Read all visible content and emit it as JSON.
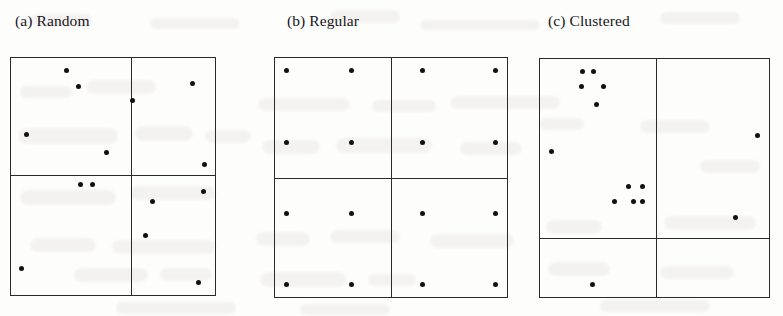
{
  "figure": {
    "caption_style": "panel-lettered",
    "background_color": "#fdfdfc",
    "ink_color": "#111113",
    "line_color": "#2a2a2c"
  },
  "panels": [
    {
      "id": "panel-a",
      "title": "(a) Random",
      "title_x": 15,
      "title_y": 12,
      "box": {
        "x": 10,
        "y": 57,
        "w": 206,
        "h": 239
      },
      "divider_x": 131,
      "divider_y": 175,
      "quadrant_counts": {
        "top_left": 4,
        "top_right": 4,
        "bottom_left": 3,
        "bottom_right": 3
      }
    },
    {
      "id": "panel-b",
      "title": "(b) Regular",
      "title_x": 287,
      "title_y": 12,
      "box": {
        "x": 274,
        "y": 57,
        "w": 234,
        "h": 241
      },
      "divider_x": 391,
      "divider_y": 178,
      "quadrant_counts": {
        "top_left": 4,
        "top_right": 4,
        "bottom_left": 4,
        "bottom_right": 4
      }
    },
    {
      "id": "panel-c",
      "title": "(c) Clustered",
      "title_x": 548,
      "title_y": 12,
      "box": {
        "x": 539,
        "y": 58,
        "w": 231,
        "h": 240
      },
      "divider_x": 656,
      "divider_y": 238,
      "quadrant_counts": {
        "top_left": 6,
        "top_right": 1,
        "bottom_left": 6,
        "bottom_right": 1
      }
    }
  ],
  "chart_data": {
    "type": "scatter",
    "xlabel": "",
    "ylabel": "",
    "grid": false,
    "legend": null,
    "axis_ticks": false,
    "note": "Three 2x2 quadrat-partitioned unit squares illustrating random, regular and clustered spatial point patterns. Coordinates are given in screenshot pixel space.",
    "series": [
      {
        "name": "(a) Random",
        "panel": "panel-a",
        "marker": "filled-circle",
        "marker_size_px": 5,
        "color": "#111113",
        "n_points": 14,
        "points": [
          [
            85,
            75
          ],
          [
            96,
            92
          ],
          [
            147,
            106
          ],
          [
            203,
            89
          ],
          [
            48,
            141
          ],
          [
            213,
            199
          ],
          [
            122,
            159
          ],
          [
            214,
            172
          ],
          [
            98,
            192
          ],
          [
            109,
            192
          ],
          [
            165,
            210
          ],
          [
            159,
            244
          ],
          [
            43,
            278
          ],
          [
            208,
            293
          ]
        ]
      },
      {
        "name": "(b) Regular",
        "panel": "panel-b",
        "marker": "filled-circle",
        "marker_size_px": 5,
        "color": "#111113",
        "n_points": 16,
        "points": [
          [
            310,
            129
          ],
          [
            368,
            129
          ],
          [
            431,
            129
          ],
          [
            496,
            129
          ],
          [
            310,
            198
          ],
          [
            368,
            198
          ],
          [
            431,
            198
          ],
          [
            496,
            198
          ],
          [
            310,
            265
          ],
          [
            368,
            265
          ],
          [
            431,
            265
          ],
          [
            496,
            265
          ],
          [
            310,
            333
          ],
          [
            368,
            333
          ],
          [
            431,
            333
          ],
          [
            496,
            333
          ]
        ]
      },
      {
        "name": "(c) Clustered",
        "panel": "panel-c",
        "marker": "filled-circle",
        "marker_size_px": 5,
        "color": "#111113",
        "n_points": 14,
        "points": [
          [
            580,
            132
          ],
          [
            590,
            132
          ],
          [
            579,
            148
          ],
          [
            599,
            148
          ],
          [
            593,
            167
          ],
          [
            551,
            217
          ],
          [
            743,
            200
          ],
          [
            623,
            253
          ],
          [
            636,
            253
          ],
          [
            610,
            269
          ],
          [
            627,
            269
          ],
          [
            636,
            269
          ],
          [
            723,
            286
          ],
          [
            589,
            357
          ]
        ]
      }
    ]
  },
  "bleed_marks": [
    {
      "x": 30,
      "y": 14,
      "w": 62,
      "h": 12,
      "r": 10
    },
    {
      "x": 150,
      "y": 18,
      "w": 90,
      "h": 11,
      "r": 16
    },
    {
      "x": 330,
      "y": 10,
      "w": 70,
      "h": 13,
      "r": 14
    },
    {
      "x": 420,
      "y": 20,
      "w": 120,
      "h": 10,
      "r": 18
    },
    {
      "x": 660,
      "y": 12,
      "w": 80,
      "h": 12,
      "r": 12
    },
    {
      "x": 20,
      "y": 86,
      "w": 52,
      "h": 12,
      "r": 10
    },
    {
      "x": 86,
      "y": 80,
      "w": 70,
      "h": 14,
      "r": 13
    },
    {
      "x": 18,
      "y": 128,
      "w": 100,
      "h": 16,
      "r": 15
    },
    {
      "x": 135,
      "y": 126,
      "w": 58,
      "h": 15,
      "r": 12
    },
    {
      "x": 205,
      "y": 130,
      "w": 46,
      "h": 13,
      "r": 11
    },
    {
      "x": 20,
      "y": 190,
      "w": 96,
      "h": 15,
      "r": 14
    },
    {
      "x": 130,
      "y": 186,
      "w": 86,
      "h": 14,
      "r": 13
    },
    {
      "x": 30,
      "y": 238,
      "w": 66,
      "h": 14,
      "r": 12
    },
    {
      "x": 112,
      "y": 240,
      "w": 104,
      "h": 14,
      "r": 16
    },
    {
      "x": 74,
      "y": 268,
      "w": 74,
      "h": 14,
      "r": 13
    },
    {
      "x": 160,
      "y": 268,
      "w": 52,
      "h": 13,
      "r": 11
    },
    {
      "x": 258,
      "y": 98,
      "w": 92,
      "h": 13,
      "r": 14
    },
    {
      "x": 372,
      "y": 100,
      "w": 64,
      "h": 12,
      "r": 12
    },
    {
      "x": 450,
      "y": 96,
      "w": 110,
      "h": 13,
      "r": 16
    },
    {
      "x": 262,
      "y": 140,
      "w": 58,
      "h": 14,
      "r": 12
    },
    {
      "x": 336,
      "y": 138,
      "w": 96,
      "h": 15,
      "r": 15
    },
    {
      "x": 460,
      "y": 142,
      "w": 62,
      "h": 13,
      "r": 12
    },
    {
      "x": 256,
      "y": 232,
      "w": 54,
      "h": 14,
      "r": 11
    },
    {
      "x": 330,
      "y": 230,
      "w": 70,
      "h": 13,
      "r": 13
    },
    {
      "x": 430,
      "y": 234,
      "w": 84,
      "h": 14,
      "r": 14
    },
    {
      "x": 260,
      "y": 272,
      "w": 86,
      "h": 15,
      "r": 14
    },
    {
      "x": 368,
      "y": 274,
      "w": 48,
      "h": 12,
      "r": 10
    },
    {
      "x": 540,
      "y": 118,
      "w": 44,
      "h": 12,
      "r": 10
    },
    {
      "x": 640,
      "y": 120,
      "w": 70,
      "h": 13,
      "r": 13
    },
    {
      "x": 700,
      "y": 160,
      "w": 60,
      "h": 13,
      "r": 12
    },
    {
      "x": 546,
      "y": 220,
      "w": 56,
      "h": 14,
      "r": 11
    },
    {
      "x": 664,
      "y": 216,
      "w": 92,
      "h": 14,
      "r": 15
    },
    {
      "x": 548,
      "y": 262,
      "w": 62,
      "h": 14,
      "r": 12
    },
    {
      "x": 660,
      "y": 266,
      "w": 74,
      "h": 13,
      "r": 13
    },
    {
      "x": 116,
      "y": 302,
      "w": 120,
      "h": 12,
      "r": 16
    },
    {
      "x": 300,
      "y": 304,
      "w": 90,
      "h": 11,
      "r": 14
    },
    {
      "x": 600,
      "y": 300,
      "w": 110,
      "h": 12,
      "r": 15
    }
  ]
}
